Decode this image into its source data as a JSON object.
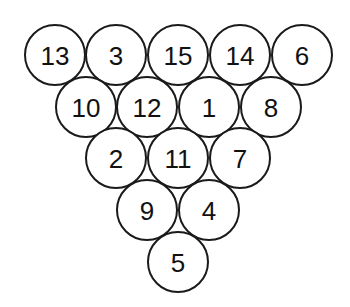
{
  "diagram": {
    "title": "",
    "type": "triangle rack of numbered balls",
    "radius": 30,
    "rows": [
      {
        "y": 55,
        "balls": [
          {
            "x": 55,
            "label": "13"
          },
          {
            "x": 116,
            "label": "3"
          },
          {
            "x": 178,
            "label": "15"
          },
          {
            "x": 240,
            "label": "14"
          },
          {
            "x": 302,
            "label": "6"
          }
        ]
      },
      {
        "y": 107,
        "balls": [
          {
            "x": 86,
            "label": "10"
          },
          {
            "x": 147,
            "label": "12"
          },
          {
            "x": 209,
            "label": "1"
          },
          {
            "x": 271,
            "label": "8"
          }
        ]
      },
      {
        "y": 158,
        "balls": [
          {
            "x": 116,
            "label": "2"
          },
          {
            "x": 178,
            "label": "11"
          },
          {
            "x": 240,
            "label": "7"
          }
        ]
      },
      {
        "y": 210,
        "balls": [
          {
            "x": 147,
            "label": "9"
          },
          {
            "x": 209,
            "label": "4"
          }
        ]
      },
      {
        "y": 262,
        "balls": [
          {
            "x": 178,
            "label": "5"
          }
        ]
      }
    ],
    "stroke_color": "#1a1a1a",
    "background_color": "#ffffff"
  }
}
